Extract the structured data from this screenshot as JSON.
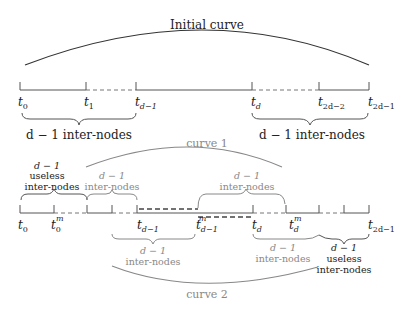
{
  "diagram": {
    "top": {
      "curve_label": "Initial curve",
      "nodes": [
        {
          "base": "t",
          "sub": "0"
        },
        {
          "base": "t",
          "sub": "1"
        },
        {
          "base": "t",
          "sub": "d−1"
        },
        {
          "base": "t",
          "sub": "d"
        },
        {
          "base": "t",
          "sub": "2d−2"
        },
        {
          "base": "t",
          "sub": "2d−1"
        }
      ],
      "brace_left_label": "d − 1 inter-nodes",
      "brace_right_label": "d − 1 inter-nodes"
    },
    "bottom": {
      "curve1_label": "curve 1",
      "curve2_label": "curve 2",
      "nodes": [
        {
          "base": "t",
          "sub": "0",
          "sup": ""
        },
        {
          "base": "t",
          "sub": "0",
          "sup": "m"
        },
        {
          "base": "t",
          "sub": "d−1",
          "sup": ""
        },
        {
          "base": "t",
          "sub": "d−1",
          "sup": "m"
        },
        {
          "base": "t",
          "sub": "d",
          "sup": ""
        },
        {
          "base": "t",
          "sub": "d",
          "sup": "m"
        },
        {
          "base": "t",
          "sub": "2d−1",
          "sup": ""
        }
      ],
      "brace_useless_left": {
        "line1": "d − 1",
        "line2": "useless",
        "line3": "inter-nodes"
      },
      "brace_curve1_left": {
        "line1": "d − 1",
        "line2": "inter-nodes"
      },
      "brace_curve1_right": {
        "line1": "d − 1",
        "line2": "inter-nodes"
      },
      "brace_curve2_left": {
        "line1": "d − 1",
        "line2": "inter-nodes"
      },
      "brace_curve2_mid": {
        "line1": "d − 1",
        "line2": "inter-nodes"
      },
      "brace_useless_right": {
        "line1": "d − 1",
        "line2": "useless",
        "line3": "inter-nodes"
      }
    }
  }
}
